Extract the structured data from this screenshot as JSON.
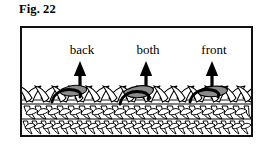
{
  "figure": {
    "caption": "Fig. 22",
    "frame": {
      "border_color": "#111111",
      "background": "#ffffff"
    }
  },
  "diagram": {
    "fabric": {
      "yarn_outline_color": "#000000",
      "yarn_fill_color": "#ffffff",
      "highlight_loop_color": "#8a8a8a",
      "hook_path_color": "#000000",
      "rows": 3,
      "top_row_stitches": 13,
      "lower_row_stitches": 14
    },
    "arrow": {
      "color": "#000000",
      "direction": "up",
      "count": 3
    },
    "markers": [
      {
        "label": "back",
        "label_x": 60,
        "label_y": 22,
        "arrow_x": 58,
        "loop_side": "back-loop-only"
      },
      {
        "label": "both",
        "label_x": 126,
        "label_y": 22,
        "arrow_x": 124,
        "loop_side": "both-loops"
      },
      {
        "label": "front",
        "label_x": 192,
        "label_y": 22,
        "arrow_x": 190,
        "loop_side": "front-loop-only"
      }
    ]
  }
}
